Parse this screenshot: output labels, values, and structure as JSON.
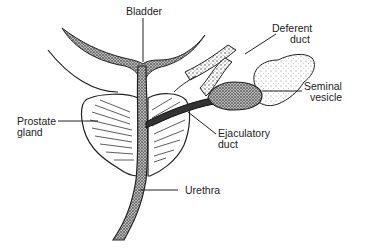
{
  "diagram": {
    "type": "anatomical illustration",
    "labels": {
      "bladder": "Bladder",
      "deferent_duct_1": "Deferent",
      "deferent_duct_2": "duct",
      "seminal_vesicle_1": "Seminal",
      "seminal_vesicle_2": "vesicle",
      "prostate_gland_1": "Prostate",
      "prostate_gland_2": "gland",
      "ejaculatory_duct_1": "Ejaculatory",
      "ejaculatory_duct_2": "duct",
      "urethra": "Urethra"
    },
    "colors": {
      "ink": "#1a1a1a",
      "stipple": "#555555",
      "background": "#ffffff"
    }
  }
}
